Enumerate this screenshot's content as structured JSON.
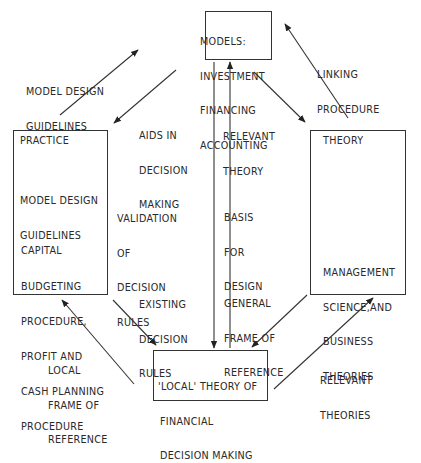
{
  "boxes": {
    "models": {
      "lines": [
        "MODELS:",
        "INVESTMENT",
        "FINANCING",
        "ACCOUNTING"
      ]
    },
    "practice": {
      "title": "PRACTICE",
      "item1": [
        "MODEL DESIGN",
        "GUIDELINES"
      ],
      "item2": [
        "CAPITAL",
        "BUDGETING",
        "PROCEDURE,",
        "PROFIT AND",
        "CASH PLANNING",
        "PROCEDURE"
      ]
    },
    "theory": {
      "title": "THEORY",
      "item1": [
        "MANAGEMENT",
        "SCIENCE,AND",
        "BUSINESS",
        "THEORIES"
      ]
    },
    "local": {
      "lines": [
        "'LOCAL' THEORY OF",
        "FINANCIAL",
        "DECISION MAKING"
      ]
    }
  },
  "labels": {
    "model_design_guidelines": [
      "MODEL DESIGN",
      "GUIDELINES"
    ],
    "linking_procedure": [
      "LINKING",
      "PROCEDURE"
    ],
    "aids_in_decision_making": [
      "AIDS IN",
      "DECISION",
      "MAKING"
    ],
    "relevant_theory": [
      "RELEVANT",
      "THEORY"
    ],
    "validation_of_decision_rules": [
      "VALIDATION",
      "OF",
      "DECISION",
      "RULES"
    ],
    "basis_for_design": [
      "BASIS",
      "FOR",
      "DESIGN"
    ],
    "existing_decision_rules": [
      "EXISTING",
      "DECISION",
      "RULES"
    ],
    "general_frame_of_reference": [
      "GENERAL",
      "FRAME OF",
      "REFERENCE"
    ],
    "local_frame_of_reference": [
      "LOCAL",
      "FRAME OF",
      "REFERENCE"
    ],
    "relevant_theories": [
      "RELEVANT",
      "THEORIES"
    ]
  }
}
